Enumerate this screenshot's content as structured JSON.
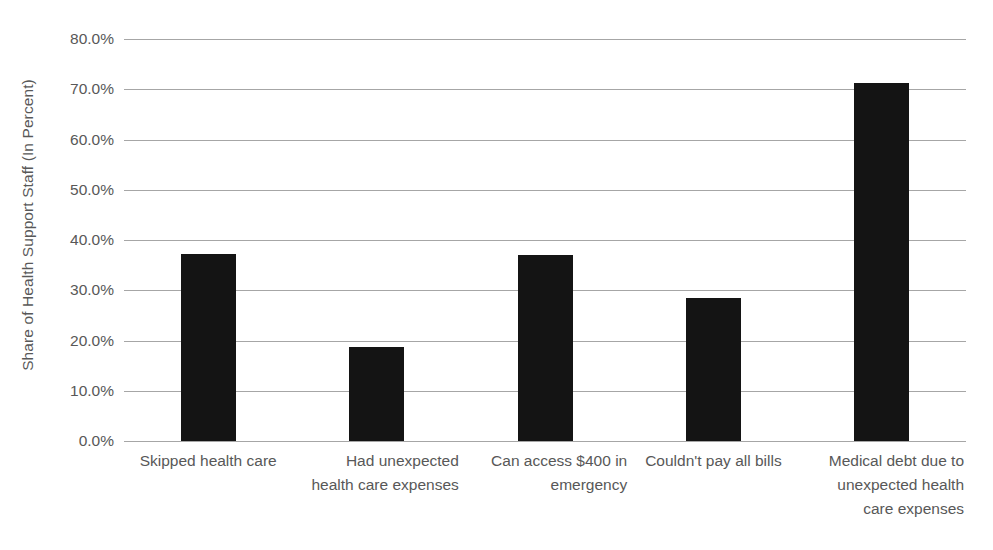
{
  "chart_data": {
    "type": "bar",
    "title": "",
    "xlabel": "",
    "ylabel": "Share of Health Support Staff (In Percent)",
    "categories": [
      "Skipped health care",
      "Had unexpected health care expenses",
      "Can access $400 in emergency",
      "Couldn't pay all bills",
      "Medical debt due to unexpected health care expenses"
    ],
    "category_lines": [
      [
        "Skipped health care"
      ],
      [
        "Had unexpected",
        "health care expenses"
      ],
      [
        "Can access $400 in",
        "emergency"
      ],
      [
        "Couldn't pay all bills"
      ],
      [
        "Medical debt due to",
        "unexpected health",
        "care expenses"
      ]
    ],
    "values": [
      37.2,
      18.7,
      37.0,
      28.5,
      71.2
    ],
    "ylim": [
      0,
      80
    ],
    "ytick_values": [
      80,
      70,
      60,
      50,
      40,
      30,
      20,
      10,
      0
    ],
    "ytick_labels": [
      "80.0%",
      "70.0%",
      "60.0%",
      "50.0%",
      "40.0%",
      "30.0%",
      "20.0%",
      "10.0%",
      "0.0%"
    ],
    "grid": true,
    "legend": "none",
    "bar_color": "#141414",
    "grid_color": "#a6a6a6",
    "text_color": "#585858"
  }
}
